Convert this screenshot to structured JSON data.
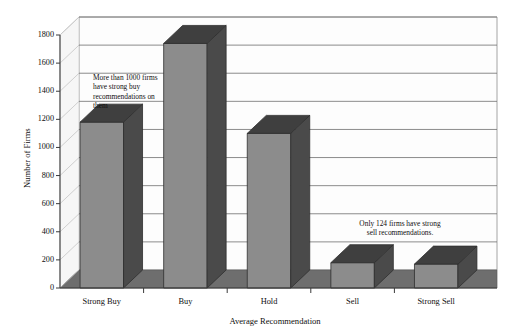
{
  "chart_data": {
    "type": "bar",
    "title": "",
    "subtitle": "",
    "xlabel": "Average Recommendation",
    "ylabel": "Number of Firms",
    "categories": [
      "Strong Buy",
      "Buy",
      "Hold",
      "Sell",
      "Strong Sell"
    ],
    "values": [
      1180,
      1740,
      1100,
      180,
      170
    ],
    "ylim": [
      0,
      1800
    ],
    "ytick_values": [
      0,
      200,
      400,
      600,
      800,
      1000,
      1200,
      1400,
      1600,
      1800
    ],
    "ytick_labels": [
      "0",
      "200",
      "400",
      "600",
      "800",
      "1000",
      "1200",
      "1400",
      "1600",
      "1800"
    ],
    "grid": true,
    "legend": "none",
    "style": "3d-column",
    "annotations": [
      {
        "name": "strong-buy-note",
        "text": "More than 1000 firms\nhave strong buy\nrecommendations on\nthem",
        "target_category": "Strong Buy"
      },
      {
        "name": "strong-sell-note",
        "text": "Only 124 firms have strong\nsell recommendations.",
        "target_category": "Strong Sell"
      }
    ]
  },
  "colors": {
    "bar_front": "#8c8c8c",
    "bar_side": "#4a4a4a",
    "bar_top": "#3f3f3f",
    "floor": "#6e6e6e",
    "back_wall": "#fdfdfd",
    "left_wall": "#f4f4f4",
    "gridline": "#6a6a6a",
    "axis": "#3a3a3a",
    "plot_border": "#9a9a9a",
    "text": "#101010",
    "page_background": "#ffffff"
  },
  "axes": {
    "y_axis_label": "Number of Firms",
    "x_axis_label": "Average Recommendation"
  }
}
